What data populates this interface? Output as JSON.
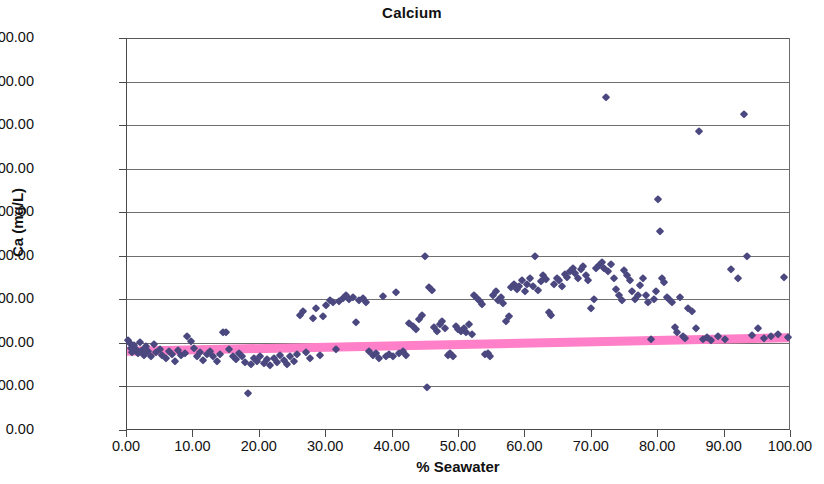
{
  "chart_data": {
    "type": "scatter",
    "title": "Calcium",
    "xlabel": "% Seawater",
    "ylabel": "Ca (mg/L)",
    "xlim": [
      0,
      100
    ],
    "ylim": [
      0,
      1800
    ],
    "xticks": [
      "0.00",
      "10.00",
      "20.00",
      "30.00",
      "40.00",
      "50.00",
      "60.00",
      "70.00",
      "80.00",
      "90.00",
      "100.00"
    ],
    "yticks": [
      "0.00",
      "200.00",
      "400.00",
      "600.00",
      "800.00",
      "1000.00",
      "1200.00",
      "1400.00",
      "1600.00",
      "1800.00"
    ],
    "xtick_step": 10,
    "ytick_step": 200,
    "grid": "horizontal",
    "legend": "none",
    "series": [
      {
        "name": "Ca measurements",
        "type": "scatter",
        "marker": "diamond",
        "color": "#4b4880",
        "points": [
          [
            0.2,
            415
          ],
          [
            0.4,
            398
          ],
          [
            0.6,
            378
          ],
          [
            0.8,
            360
          ],
          [
            1.0,
            392
          ],
          [
            1.3,
            372
          ],
          [
            1.6,
            352
          ],
          [
            1.9,
            404
          ],
          [
            2.2,
            368
          ],
          [
            2.5,
            345
          ],
          [
            2.9,
            385
          ],
          [
            3.2,
            362
          ],
          [
            3.6,
            340
          ],
          [
            4.0,
            395
          ],
          [
            4.4,
            358
          ],
          [
            4.9,
            372
          ],
          [
            5.3,
            345
          ],
          [
            5.8,
            330
          ],
          [
            6.3,
            362
          ],
          [
            6.8,
            350
          ],
          [
            7.2,
            318
          ],
          [
            7.7,
            368
          ],
          [
            8.2,
            344
          ],
          [
            8.7,
            352
          ],
          [
            9.1,
            430
          ],
          [
            9.6,
            408
          ],
          [
            10.1,
            375
          ],
          [
            10.6,
            340
          ],
          [
            11.0,
            358
          ],
          [
            11.5,
            322
          ],
          [
            12.0,
            347
          ],
          [
            12.5,
            362
          ],
          [
            13.0,
            338
          ],
          [
            13.5,
            318
          ],
          [
            14.0,
            350
          ],
          [
            14.4,
            452
          ],
          [
            14.9,
            448
          ],
          [
            15.4,
            372
          ],
          [
            15.9,
            342
          ],
          [
            16.4,
            325
          ],
          [
            16.9,
            355
          ],
          [
            17.3,
            338
          ],
          [
            17.8,
            312
          ],
          [
            18.2,
            172
          ],
          [
            18.6,
            305
          ],
          [
            19.1,
            330
          ],
          [
            19.6,
            318
          ],
          [
            20.1,
            342
          ],
          [
            20.6,
            308
          ],
          [
            21.1,
            325
          ],
          [
            21.6,
            300
          ],
          [
            22.1,
            330
          ],
          [
            22.6,
            312
          ],
          [
            23.1,
            345
          ],
          [
            23.6,
            322
          ],
          [
            24.1,
            302
          ],
          [
            24.6,
            338
          ],
          [
            25.1,
            318
          ],
          [
            25.6,
            348
          ],
          [
            26.0,
            530
          ],
          [
            26.5,
            545
          ],
          [
            27.0,
            358
          ],
          [
            27.5,
            332
          ],
          [
            28.0,
            512
          ],
          [
            28.5,
            560
          ],
          [
            29.0,
            345
          ],
          [
            29.5,
            522
          ],
          [
            30.0,
            572
          ],
          [
            30.5,
            598
          ],
          [
            31.0,
            588
          ],
          [
            31.5,
            372
          ],
          [
            32.0,
            592
          ],
          [
            32.5,
            608
          ],
          [
            33.0,
            618
          ],
          [
            33.5,
            602
          ],
          [
            34.0,
            612
          ],
          [
            34.5,
            498
          ],
          [
            35.0,
            598
          ],
          [
            35.5,
            605
          ],
          [
            36.0,
            588
          ],
          [
            36.5,
            362
          ],
          [
            37.0,
            345
          ],
          [
            37.5,
            352
          ],
          [
            38.0,
            330
          ],
          [
            38.5,
            614
          ],
          [
            39.0,
            342
          ],
          [
            39.5,
            348
          ],
          [
            40.0,
            338
          ],
          [
            40.5,
            632
          ],
          [
            41.0,
            355
          ],
          [
            41.5,
            362
          ],
          [
            42.0,
            345
          ],
          [
            42.5,
            492
          ],
          [
            43.0,
            478
          ],
          [
            43.5,
            462
          ],
          [
            44.0,
            510
          ],
          [
            44.5,
            530
          ],
          [
            44.9,
            800
          ],
          [
            45.2,
            198
          ],
          [
            45.5,
            655
          ],
          [
            45.9,
            645
          ],
          [
            46.3,
            472
          ],
          [
            46.7,
            455
          ],
          [
            47.1,
            488
          ],
          [
            47.5,
            500
          ],
          [
            47.9,
            468
          ],
          [
            48.3,
            345
          ],
          [
            48.7,
            352
          ],
          [
            49.1,
            338
          ],
          [
            49.5,
            478
          ],
          [
            49.9,
            462
          ],
          [
            50.3,
            455
          ],
          [
            50.7,
            470
          ],
          [
            51.1,
            452
          ],
          [
            51.5,
            488
          ],
          [
            51.9,
            440
          ],
          [
            52.3,
            618
          ],
          [
            52.7,
            605
          ],
          [
            53.1,
            592
          ],
          [
            53.5,
            578
          ],
          [
            53.9,
            348
          ],
          [
            54.3,
            355
          ],
          [
            54.7,
            342
          ],
          [
            55.1,
            620
          ],
          [
            55.5,
            640
          ],
          [
            55.9,
            598
          ],
          [
            56.3,
            612
          ],
          [
            56.7,
            582
          ],
          [
            57.1,
            500
          ],
          [
            57.5,
            522
          ],
          [
            57.9,
            658
          ],
          [
            58.3,
            672
          ],
          [
            58.7,
            648
          ],
          [
            59.1,
            660
          ],
          [
            59.5,
            688
          ],
          [
            59.9,
            640
          ],
          [
            60.3,
            672
          ],
          [
            60.7,
            698
          ],
          [
            61.1,
            660
          ],
          [
            61.5,
            800
          ],
          [
            61.9,
            645
          ],
          [
            62.3,
            682
          ],
          [
            62.7,
            712
          ],
          [
            63.1,
            695
          ],
          [
            63.5,
            540
          ],
          [
            63.9,
            528
          ],
          [
            64.3,
            672
          ],
          [
            64.7,
            700
          ],
          [
            65.1,
            688
          ],
          [
            65.5,
            660
          ],
          [
            65.9,
            718
          ],
          [
            66.3,
            702
          ],
          [
            66.7,
            730
          ],
          [
            67.1,
            745
          ],
          [
            67.5,
            720
          ],
          [
            67.9,
            698
          ],
          [
            68.3,
            738
          ],
          [
            68.7,
            755
          ],
          [
            69.1,
            712
          ],
          [
            69.5,
            688
          ],
          [
            69.9,
            560
          ],
          [
            70.3,
            600
          ],
          [
            70.7,
            742
          ],
          [
            71.1,
            758
          ],
          [
            71.5,
            772
          ],
          [
            71.9,
            745
          ],
          [
            72.2,
            1528
          ],
          [
            72.5,
            728
          ],
          [
            72.9,
            760
          ],
          [
            73.3,
            700
          ],
          [
            73.7,
            648
          ],
          [
            74.1,
            622
          ],
          [
            74.5,
            598
          ],
          [
            74.9,
            735
          ],
          [
            75.3,
            712
          ],
          [
            75.7,
            688
          ],
          [
            76.1,
            640
          ],
          [
            76.5,
            600
          ],
          [
            76.9,
            620
          ],
          [
            77.3,
            665
          ],
          [
            77.7,
            700
          ],
          [
            78.1,
            620
          ],
          [
            78.5,
            588
          ],
          [
            78.9,
            420
          ],
          [
            79.3,
            600
          ],
          [
            79.7,
            640
          ],
          [
            79.9,
            1060
          ],
          [
            80.2,
            912
          ],
          [
            80.5,
            700
          ],
          [
            80.9,
            678
          ],
          [
            81.3,
            612
          ],
          [
            81.7,
            600
          ],
          [
            82.1,
            588
          ],
          [
            82.5,
            475
          ],
          [
            82.9,
            452
          ],
          [
            83.3,
            612
          ],
          [
            83.7,
            430
          ],
          [
            84.1,
            422
          ],
          [
            84.5,
            560
          ],
          [
            85.1,
            545
          ],
          [
            85.7,
            470
          ],
          [
            86.2,
            1372
          ],
          [
            86.8,
            418
          ],
          [
            87.4,
            425
          ],
          [
            88.0,
            412
          ],
          [
            89.0,
            430
          ],
          [
            90.0,
            418
          ],
          [
            91.0,
            740
          ],
          [
            92.0,
            700
          ],
          [
            92.9,
            1452
          ],
          [
            93.4,
            800
          ],
          [
            94.2,
            438
          ],
          [
            95.0,
            470
          ],
          [
            96.0,
            422
          ],
          [
            97.0,
            432
          ],
          [
            98.0,
            440
          ],
          [
            99.0,
            702
          ],
          [
            99.6,
            425
          ]
        ]
      },
      {
        "name": "Conservative mixing line",
        "type": "line",
        "color": "#ff80c8",
        "width": 9,
        "from": [
          0,
          358
        ],
        "to": [
          100,
          420
        ]
      }
    ]
  }
}
